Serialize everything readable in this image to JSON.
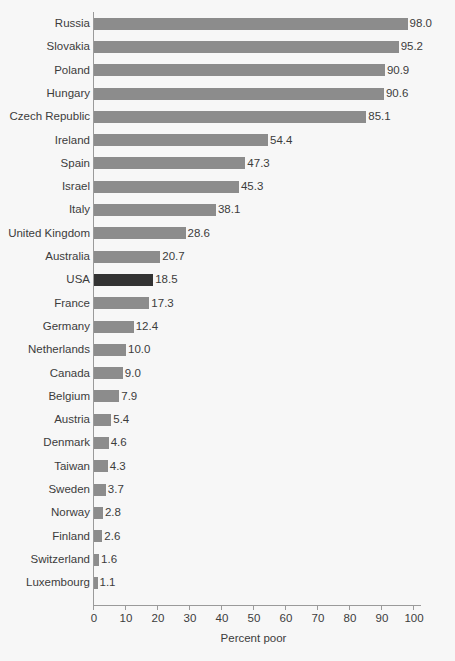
{
  "chart_data": {
    "type": "bar",
    "orientation": "horizontal",
    "title": "",
    "xlabel": "Percent poor",
    "ylabel": "",
    "xlim": [
      0,
      100
    ],
    "xticks": [
      0,
      10,
      20,
      30,
      40,
      50,
      60,
      70,
      80,
      90,
      100
    ],
    "xtick_labels": [
      "0",
      "10",
      "20",
      "30",
      "40",
      "50",
      "60",
      "70",
      "80",
      "90",
      "100"
    ],
    "grid": false,
    "legend": "none",
    "categories": [
      "Russia",
      "Slovakia",
      "Poland",
      "Hungary",
      "Czech Republic",
      "Ireland",
      "Spain",
      "Israel",
      "Italy",
      "United Kingdom",
      "Australia",
      "USA",
      "France",
      "Germany",
      "Netherlands",
      "Canada",
      "Belgium",
      "Austria",
      "Denmark",
      "Taiwan",
      "Sweden",
      "Norway",
      "Finland",
      "Switzerland",
      "Luxembourg"
    ],
    "values": [
      98.0,
      95.2,
      90.9,
      90.6,
      85.1,
      54.4,
      47.3,
      45.3,
      38.1,
      28.6,
      20.7,
      18.5,
      17.3,
      12.4,
      10.0,
      9.0,
      7.9,
      5.4,
      4.6,
      4.3,
      3.7,
      2.8,
      2.6,
      1.6,
      1.1
    ],
    "value_labels": [
      "98.0",
      "95.2",
      "90.9",
      "90.6",
      "85.1",
      "54.4",
      "47.3",
      "45.3",
      "38.1",
      "28.6",
      "20.7",
      "18.5",
      "17.3",
      "12.4",
      "10.0",
      "9.0",
      "7.9",
      "5.4",
      "4.6",
      "4.3",
      "3.7",
      "2.8",
      "2.6",
      "1.6",
      "1.1"
    ],
    "highlight_category": "USA",
    "colors": {
      "bar": "#8c8c8c",
      "bar_highlight": "#333333",
      "axis": "#9a9a9a",
      "text": "#3c3c3c",
      "background": "#f7f7f7"
    }
  }
}
